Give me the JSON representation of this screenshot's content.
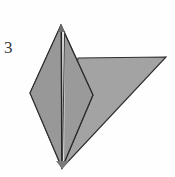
{
  "figure": {
    "step_label": "3",
    "caption": "",
    "background_color": "#fefefe",
    "paper_fill_front": "#9a9a9a",
    "paper_fill_back": "#a0a0a0",
    "outline_color": "#2e2e2e",
    "crease_color": "#3a3a3a",
    "width": 175,
    "height": 177
  },
  "shapes": {
    "kite": {
      "name": "kite-panel",
      "points": "61,25 30,93 62,168 93,95",
      "fill": "#9a9a9a"
    },
    "right_flap": {
      "name": "right-flap-panel",
      "points": "78,58 166,57 62,168",
      "fill": "#a0a0a0"
    },
    "left_half_shadow": {
      "name": "kite-left-half",
      "points": "61,25 30,93 62,168",
      "fill": "#979797"
    },
    "center_crease": {
      "name": "center-crease-line",
      "x1": 61.5,
      "y1": 26,
      "x2": 62,
      "y2": 167
    },
    "center_crease_highlight": {
      "name": "center-crease-highlight",
      "x1": 63.5,
      "y1": 30,
      "x2": 63.5,
      "y2": 166
    },
    "inner_fold_edge": {
      "name": "inner-fold-edge",
      "x1": 60,
      "y1": 25,
      "x2": 62,
      "y2": 168
    }
  },
  "vertices": {
    "top_apex": {
      "name": "top-apex-point",
      "x": 61,
      "y": 25
    },
    "left_point": {
      "name": "left-point",
      "x": 30,
      "y": 93
    },
    "bottom_point": {
      "name": "bottom-point",
      "x": 62,
      "y": 168
    },
    "kite_right_point": {
      "name": "kite-right-point",
      "x": 93,
      "y": 95
    },
    "flap_top_left": {
      "name": "flap-top-left-point",
      "x": 78,
      "y": 58
    },
    "flap_right_tip": {
      "name": "flap-right-tip-point",
      "x": 166,
      "y": 57
    }
  }
}
